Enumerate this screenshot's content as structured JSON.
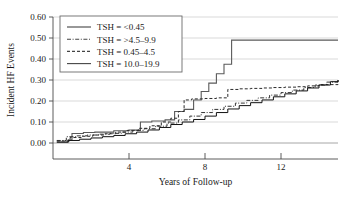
{
  "chart_data": {
    "type": "line",
    "title": "",
    "subtitle": "",
    "xlabel": "Years of Follow-up",
    "ylabel": "Incident HF Events",
    "xlim": [
      0,
      15
    ],
    "ylim": [
      0.0,
      0.6
    ],
    "xticks": [
      4,
      8,
      12
    ],
    "xticklabels": [
      "4",
      "8",
      "12"
    ],
    "yticks": [
      0.0,
      0.1,
      0.2,
      0.3,
      0.4,
      0.5,
      0.6
    ],
    "yticklabels": [
      "0.00",
      "0.10",
      "0.20",
      "0.30",
      "0.40",
      "0.50",
      "0.60"
    ],
    "grid": "horizontal",
    "legend_position": "upper-left",
    "step_style": "post",
    "series": [
      {
        "name": "TSH = <0.45",
        "line_style": "solid",
        "color": "#5a5a5a",
        "width": 1.1,
        "x": [
          0.2,
          0.8,
          1.0,
          1.6,
          2.2,
          3.2,
          4.0,
          4.6,
          5.2,
          5.9,
          6.4,
          6.9,
          7.4,
          7.8,
          8.2,
          8.6,
          9.0,
          9.4,
          15.0
        ],
        "y": [
          0.005,
          0.015,
          0.045,
          0.05,
          0.052,
          0.058,
          0.062,
          0.1,
          0.105,
          0.11,
          0.15,
          0.16,
          0.205,
          0.245,
          0.285,
          0.33,
          0.375,
          0.49,
          0.49
        ]
      },
      {
        "name": "TSH = >4.5–9.9",
        "line_style": "dashdot",
        "color": "#333333",
        "width": 1.0,
        "x": [
          0.2,
          0.7,
          1.2,
          1.8,
          2.4,
          3.0,
          3.6,
          4.2,
          4.8,
          5.4,
          6.0,
          6.6,
          7.2,
          7.8,
          8.4,
          9.0,
          9.6,
          10.2,
          10.8,
          11.4,
          12.0,
          12.6,
          13.2,
          13.8,
          14.4,
          15.0
        ],
        "y": [
          0.012,
          0.03,
          0.034,
          0.038,
          0.042,
          0.046,
          0.052,
          0.06,
          0.068,
          0.08,
          0.095,
          0.11,
          0.128,
          0.145,
          0.16,
          0.175,
          0.19,
          0.203,
          0.215,
          0.228,
          0.24,
          0.252,
          0.264,
          0.276,
          0.29,
          0.3
        ]
      },
      {
        "name": "TSH = 0.45–4.5",
        "line_style": "dashed",
        "color": "#2b2b2b",
        "width": 1.0,
        "x": [
          0.2,
          0.9,
          1.5,
          2.1,
          2.7,
          3.3,
          3.9,
          4.5,
          5.1,
          5.7,
          6.2,
          6.6,
          6.9,
          7.3,
          8.0,
          8.6,
          9.2,
          9.8,
          10.4,
          11.0,
          11.6,
          12.2,
          12.8,
          13.4,
          14.0,
          15.0
        ],
        "y": [
          0.01,
          0.026,
          0.032,
          0.038,
          0.044,
          0.052,
          0.06,
          0.07,
          0.082,
          0.1,
          0.118,
          0.15,
          0.205,
          0.21,
          0.212,
          0.215,
          0.255,
          0.258,
          0.26,
          0.262,
          0.264,
          0.266,
          0.268,
          0.272,
          0.278,
          0.3
        ]
      },
      {
        "name": "TSH = 10.0–19.9",
        "line_style": "solid-thin",
        "color": "#111111",
        "width": 1.0,
        "x": [
          0.2,
          0.8,
          1.4,
          2.0,
          2.6,
          3.2,
          3.8,
          4.4,
          5.0,
          5.6,
          6.2,
          6.8,
          7.4,
          8.0,
          8.6,
          9.2,
          9.8,
          10.4,
          11.0,
          11.6,
          12.2,
          12.8,
          13.4,
          14.0,
          14.6,
          15.0
        ],
        "y": [
          0.004,
          0.012,
          0.018,
          0.024,
          0.03,
          0.036,
          0.044,
          0.052,
          0.062,
          0.074,
          0.088,
          0.1,
          0.112,
          0.128,
          0.145,
          0.162,
          0.178,
          0.192,
          0.205,
          0.22,
          0.234,
          0.248,
          0.262,
          0.276,
          0.292,
          0.3
        ]
      }
    ],
    "legend": [
      {
        "label": "TSH = <0.45",
        "dash": "none"
      },
      {
        "label": "TSH = >4.5–9.9",
        "dash": "dashdot"
      },
      {
        "label": "TSH = 0.45–4.5",
        "dash": "dashed"
      },
      {
        "label": "TSH = 10.0–19.9",
        "dash": "none"
      }
    ]
  }
}
